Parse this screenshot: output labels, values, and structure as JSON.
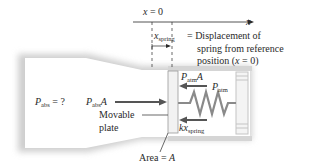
{
  "diagram": {
    "axis": {
      "origin_label_var": "x",
      "origin_label_rest": " = 0",
      "axis_label": "x"
    },
    "displacement": {
      "symbol_var": "x",
      "symbol_sub": "spring",
      "description_line1": "= Displacement of",
      "description_line2": "spring from reference",
      "description_line3_pre": "position (",
      "description_line3_var": "x",
      "description_line3_post": " = 0)"
    },
    "pressure_unknown": {
      "var": "P",
      "sub": "abs",
      "rest": " = ?"
    },
    "force_abs": {
      "var": "P",
      "sub": "abs",
      "post": "A"
    },
    "force_atm": {
      "var": "P",
      "sub": "atm",
      "post": "A"
    },
    "pressure_atm": {
      "var": "P",
      "sub": "atm"
    },
    "force_spring": {
      "var": "kx",
      "sub": "spring"
    },
    "plate_label_line1": "Movable",
    "plate_label_line2": "plate",
    "area_label_pre": "Area = ",
    "area_label_var": "A",
    "colors": {
      "tube_shadow": "#c8c8c8",
      "tube_fill": "#ffffff",
      "arrow": "#555555",
      "spring": "#8a8a8a",
      "plate_fill": "#f2f2f2",
      "plate_stroke": "#9a9a9a"
    }
  }
}
